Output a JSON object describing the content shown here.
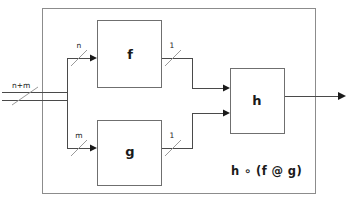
{
  "diagram": {
    "formula": "h ∘ (f @ g)",
    "colors": {
      "background": "#ffffff",
      "wire": "#4a4a4a",
      "slash": "#9a9a9a",
      "boundary": "#8c8c8c",
      "block_border": "#6f6f6f",
      "text": "#1a1a1a"
    },
    "boundary": {
      "name": "outer-boundary",
      "x": 42,
      "y": 8,
      "width": 274,
      "height": 186
    },
    "blocks": [
      {
        "id": "f",
        "label": "f",
        "x": 97,
        "y": 20,
        "width": 65,
        "height": 68
      },
      {
        "id": "g",
        "label": "g",
        "x": 97,
        "y": 120,
        "width": 65,
        "height": 66
      },
      {
        "id": "h",
        "label": "h",
        "x": 230,
        "y": 68,
        "width": 55,
        "height": 66
      }
    ],
    "signals": [
      {
        "id": "input-bus",
        "label": "n+m",
        "width_label": "n+m",
        "role": "external-input"
      },
      {
        "id": "f-input",
        "label": "n",
        "width_label": "n",
        "role": "branch-to-f"
      },
      {
        "id": "g-input",
        "label": "m",
        "width_label": "m",
        "role": "branch-to-g"
      },
      {
        "id": "f-output",
        "label": "1",
        "width_label": "1",
        "role": "f-to-h"
      },
      {
        "id": "g-output",
        "label": "1",
        "width_label": "1",
        "role": "g-to-h"
      },
      {
        "id": "output-bus",
        "label": "",
        "width_label": "",
        "role": "external-output"
      }
    ],
    "labels": {
      "input_bus": "n+m",
      "branch_n": "n",
      "branch_m": "m",
      "f_out": "1",
      "g_out": "1",
      "block_f": "f",
      "block_g": "g",
      "block_h": "h",
      "formula": "h ∘ (f @ g)"
    }
  }
}
